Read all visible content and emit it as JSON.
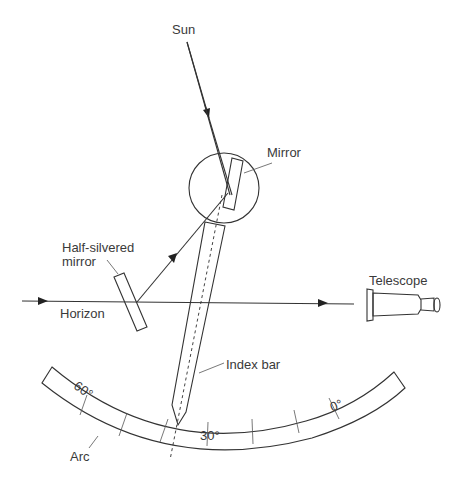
{
  "diagram": {
    "labels": {
      "sun": "Sun",
      "mirror": "Mirror",
      "half_silvered_mirror_line1": "Half-silvered",
      "half_silvered_mirror_line2": "mirror",
      "horizon": "Horizon",
      "telescope": "Telescope",
      "index_bar": "Index bar",
      "arc": "Arc"
    },
    "scale_marks": {
      "mark_60": "60°",
      "mark_30": "30°",
      "mark_0": "0°"
    },
    "colors": {
      "line": "#333333",
      "text": "#3a3a3a",
      "background": "#ffffff"
    }
  }
}
